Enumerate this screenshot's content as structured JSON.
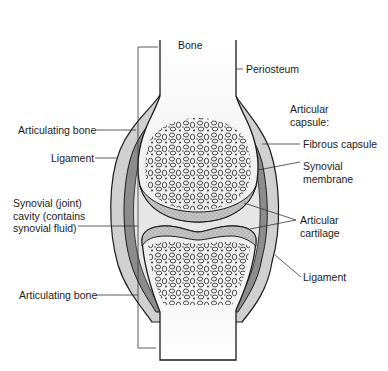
{
  "labels": {
    "bone": "Bone",
    "periosteum": "Periosteum",
    "articular_capsule": [
      "Articular",
      "capsule:"
    ],
    "fibrous_capsule": "Fibrous capsule",
    "synovial_membrane": [
      "Synovial",
      "membrane"
    ],
    "articular_cartilage": [
      "Articular",
      "cartilage"
    ],
    "ligament_right": "Ligament",
    "articulating_bone_top": "Articulating bone",
    "ligament_left": "Ligament",
    "synovial_cavity": [
      "Synovial (joint)",
      "cavity (contains",
      "synovial fluid)"
    ],
    "articulating_bone_bottom": "Articulating bone"
  },
  "colors": {
    "outline": "#1a1a1a",
    "bone_fill": "#f4f4f4",
    "capsule_fill": "#d0d0d0",
    "membrane_fill": "#8a8a8a",
    "cavity_fill": "#e6e6e6",
    "cartilage_fill": "#bdbdbd",
    "leader": "#333333"
  }
}
